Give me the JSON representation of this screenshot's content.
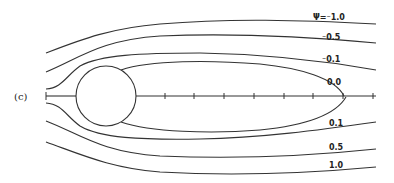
{
  "figure": {
    "panel_label": "(c)",
    "psi_prefix": "Ψ=",
    "streamline_labels": {
      "top_1": "⁻1.0",
      "top_05": "⁻0.5",
      "top_01": "⁻0.1",
      "zero": "0.0",
      "bot_01": "0.1",
      "bot_05": "0.5",
      "bot_10": "1.0"
    },
    "axis_ticks_count": 9,
    "colors": {
      "line": "#333333",
      "background": "#ffffff"
    }
  }
}
